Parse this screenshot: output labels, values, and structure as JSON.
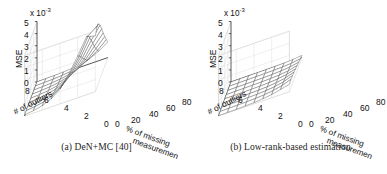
{
  "figure": {
    "panels": [
      {
        "id": "panel-a",
        "caption": "(a) DeN+MC [40]",
        "exponent_prefix": "x 10",
        "exponent_power": "-3",
        "zlabel": "MSE",
        "xlabel_line1": "% of missing",
        "xlabel_line2": "measuremen",
        "ylabel": "# of outliers",
        "zticks": [
          "0",
          "1",
          "2",
          "3",
          "4",
          "5"
        ],
        "yticks": [
          "0",
          "2",
          "4",
          "6",
          "8"
        ],
        "xticks": [
          "0",
          "20",
          "40",
          "60",
          "80"
        ]
      },
      {
        "id": "panel-b",
        "caption": "(b) Low-rank-based estimation",
        "exponent_prefix": "x 10",
        "exponent_power": "-3",
        "zlabel": "MSE",
        "xlabel_line1": "% of missing",
        "xlabel_line2": "measuremen",
        "ylabel": "# of outliers",
        "zticks": [
          "0",
          "1",
          "2",
          "3",
          "4",
          "5"
        ],
        "yticks": [
          "0",
          "2",
          "4",
          "6",
          "8"
        ],
        "xticks": [
          "0",
          "20",
          "40",
          "60",
          "80"
        ]
      }
    ]
  },
  "chart_data": [
    {
      "type": "line",
      "subtype": "surface-mesh-3d",
      "title": "(a) DeN+MC [40]",
      "xlabel": "% of missing measurements",
      "ylabel": "# of outliers",
      "zlabel": "MSE",
      "z_scale": "x 10^-3",
      "xlim": [
        0,
        80
      ],
      "ylim": [
        0,
        8
      ],
      "zlim": [
        0,
        5
      ],
      "xticks": [
        0,
        20,
        40,
        60,
        80
      ],
      "yticks": [
        0,
        2,
        4,
        6,
        8
      ],
      "zticks": [
        0,
        1,
        2,
        3,
        4,
        5
      ],
      "grid": true,
      "legend": "none",
      "x": [
        0,
        10,
        20,
        30,
        40,
        50,
        60,
        70,
        80
      ],
      "y": [
        0,
        1,
        2,
        3,
        4,
        5,
        6,
        7,
        8
      ],
      "z_units": "1e-3",
      "z": [
        [
          0.02,
          0.03,
          0.05,
          0.08,
          0.14,
          0.25,
          0.45,
          0.8,
          1.3
        ],
        [
          0.03,
          0.05,
          0.08,
          0.13,
          0.22,
          0.4,
          0.7,
          1.2,
          1.85
        ],
        [
          0.04,
          0.07,
          0.11,
          0.19,
          0.32,
          0.58,
          1.0,
          1.7,
          2.45
        ],
        [
          0.05,
          0.09,
          0.15,
          0.26,
          0.45,
          0.8,
          1.4,
          2.25,
          3.1
        ],
        [
          0.06,
          0.11,
          0.19,
          0.34,
          0.6,
          1.05,
          1.8,
          2.85,
          3.8
        ],
        [
          0.07,
          0.13,
          0.23,
          0.42,
          0.75,
          1.35,
          2.25,
          3.45,
          4.45
        ],
        [
          0.08,
          0.15,
          0.27,
          0.5,
          0.92,
          1.65,
          2.7,
          4.0,
          4.9
        ],
        [
          0.09,
          0.17,
          0.31,
          0.58,
          1.08,
          1.95,
          3.1,
          4.5,
          5.05
        ],
        [
          0.1,
          0.19,
          0.35,
          0.66,
          1.22,
          2.2,
          3.45,
          4.8,
          4.6
        ]
      ]
    },
    {
      "type": "line",
      "subtype": "surface-mesh-3d",
      "title": "(b) Low-rank-based estimation",
      "xlabel": "% of missing measurements",
      "ylabel": "# of outliers",
      "zlabel": "MSE",
      "z_scale": "x 10^-3",
      "xlim": [
        0,
        80
      ],
      "ylim": [
        0,
        8
      ],
      "zlim": [
        0,
        5
      ],
      "xticks": [
        0,
        20,
        40,
        60,
        80
      ],
      "yticks": [
        0,
        2,
        4,
        6,
        8
      ],
      "zticks": [
        0,
        1,
        2,
        3,
        4,
        5
      ],
      "grid": true,
      "legend": "none",
      "x": [
        0,
        10,
        20,
        30,
        40,
        50,
        60,
        70,
        80
      ],
      "y": [
        0,
        1,
        2,
        3,
        4,
        5,
        6,
        7,
        8
      ],
      "z_units": "1e-3",
      "z": [
        [
          0.01,
          0.01,
          0.02,
          0.02,
          0.03,
          0.04,
          0.06,
          0.1,
          0.18
        ],
        [
          0.01,
          0.01,
          0.02,
          0.03,
          0.04,
          0.05,
          0.08,
          0.13,
          0.24
        ],
        [
          0.01,
          0.02,
          0.02,
          0.03,
          0.04,
          0.06,
          0.1,
          0.17,
          0.32
        ],
        [
          0.01,
          0.02,
          0.03,
          0.04,
          0.05,
          0.08,
          0.12,
          0.21,
          0.4
        ],
        [
          0.02,
          0.02,
          0.03,
          0.04,
          0.06,
          0.09,
          0.15,
          0.26,
          0.48
        ],
        [
          0.02,
          0.03,
          0.04,
          0.05,
          0.07,
          0.11,
          0.18,
          0.31,
          0.56
        ],
        [
          0.02,
          0.03,
          0.04,
          0.06,
          0.08,
          0.13,
          0.21,
          0.36,
          0.62
        ],
        [
          0.02,
          0.03,
          0.05,
          0.06,
          0.09,
          0.14,
          0.24,
          0.4,
          0.66
        ],
        [
          0.03,
          0.04,
          0.05,
          0.07,
          0.1,
          0.16,
          0.26,
          0.43,
          0.6
        ]
      ]
    }
  ]
}
